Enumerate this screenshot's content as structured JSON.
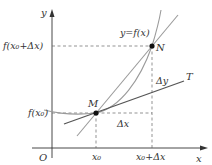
{
  "figure": {
    "labels": {
      "y_axis": "y",
      "x_axis": "x",
      "origin": "O",
      "curve": "y=f(x)",
      "point_m": "M",
      "point_n": "N",
      "tangent": "T",
      "delta_y": "Δy",
      "delta_x": "Δx",
      "f_x0": "f(x₀)",
      "f_x0_dx": "f(x₀+Δx)",
      "x0": "x₀",
      "x0_dx": "x₀+Δx"
    },
    "colors": {
      "axis": "#333333",
      "curve": "#9a9a9a",
      "secant": "#9a9a9a",
      "tangent": "#555555",
      "dashed": "#666666",
      "point": "#111111"
    }
  }
}
